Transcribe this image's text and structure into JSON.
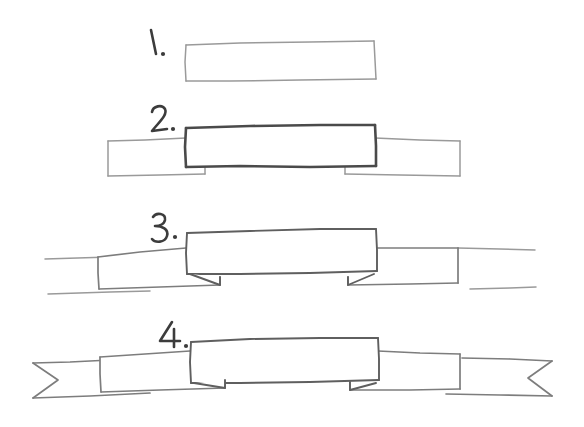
{
  "document": {
    "title": "How to draw a ribbon banner",
    "kind": "hand-drawn step-by-step sketch",
    "background_color": "#ffffff",
    "ink_color_light": "#9a9a9a",
    "ink_color_mid": "#7d7d7d",
    "ink_color_dark": "#4a4a4a",
    "numeral_color": "#3c3c3c"
  },
  "steps": [
    {
      "number": "1.",
      "caption": "",
      "description": "Draw a single horizontal rectangle — the center panel of the banner.",
      "label_x": 152,
      "label_y": 46
    },
    {
      "number": "2.",
      "caption": "",
      "description": "Add a wing rectangle on each side, overlapping behind the center panel, with a small notch stepping down at each bottom corner.",
      "label_x": 155,
      "label_y": 122
    },
    {
      "number": "3.",
      "caption": "",
      "description": "Extend horizontal lines outward from the top and bottom of each wing toward the page edges.",
      "label_x": 157,
      "label_y": 228
    },
    {
      "number": "4.",
      "caption": "",
      "description": "Close the outer ends with V-shaped swallowtail notches to finish the ribbon.",
      "label_x": 167,
      "label_y": 336
    }
  ],
  "geometry": {
    "step1": {
      "center_panel": {
        "x": 185,
        "y": 42,
        "width": 190,
        "height": 39
      }
    },
    "step2": {
      "center_panel": {
        "x": 185,
        "y": 126,
        "width": 190,
        "height": 39
      },
      "left_wing": {
        "x": 108,
        "y": 140,
        "width": 77,
        "height": 34
      },
      "right_wing": {
        "x": 375,
        "y": 140,
        "width": 85,
        "height": 34
      }
    },
    "step3": {
      "center_panel": {
        "x": 186,
        "y": 229,
        "width": 190,
        "height": 39
      },
      "left_wing": {
        "x": 98,
        "y": 243,
        "width": 88,
        "height": 34
      },
      "right_wing": {
        "x": 376,
        "y": 243,
        "width": 82,
        "height": 34
      },
      "left_extension_top_x": 45,
      "right_extension_top_x": 535,
      "left_extension_bottom_x": 48,
      "right_extension_bottom_x": 535
    },
    "step4": {
      "center_panel": {
        "x": 190,
        "y": 338,
        "width": 188,
        "height": 39
      },
      "left_wing": {
        "x": 100,
        "y": 352,
        "width": 90,
        "height": 34
      },
      "right_wing": {
        "x": 378,
        "y": 352,
        "width": 82,
        "height": 34
      },
      "left_tail_outer_x": 33,
      "left_tail_point_x": 58,
      "right_tail_outer_x": 552,
      "right_tail_point_x": 528
    }
  }
}
